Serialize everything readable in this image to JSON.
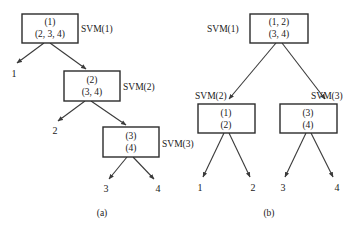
{
  "figure": {
    "panels": [
      {
        "id": "a",
        "caption": "(a)",
        "nodes": [
          {
            "id": "a-n1",
            "line1": "(1)",
            "line2": "(2, 3, 4)",
            "svm": "SVM(1)"
          },
          {
            "id": "a-n2",
            "line1": "(2)",
            "line2": "(3, 4)",
            "svm": "SVM(2)"
          },
          {
            "id": "a-n3",
            "line1": "(3)",
            "line2": "(4)",
            "svm": "SVM(3)"
          }
        ],
        "leaves": [
          {
            "id": "a-l1",
            "label": "1"
          },
          {
            "id": "a-l2",
            "label": "2"
          },
          {
            "id": "a-l3",
            "label": "3"
          },
          {
            "id": "a-l4",
            "label": "4"
          }
        ]
      },
      {
        "id": "b",
        "caption": "(b)",
        "nodes": [
          {
            "id": "b-n1",
            "line1": "(1, 2)",
            "line2": "(3, 4)",
            "svm": "SVM(1)"
          },
          {
            "id": "b-n2",
            "line1": "(1)",
            "line2": "(2)",
            "svm": "SVM(2)"
          },
          {
            "id": "b-n3",
            "line1": "(3)",
            "line2": "(4)",
            "svm": "SVM(3)"
          }
        ],
        "leaves": [
          {
            "id": "b-l1",
            "label": "1"
          },
          {
            "id": "b-l2",
            "label": "2"
          },
          {
            "id": "b-l3",
            "label": "3"
          },
          {
            "id": "b-l4",
            "label": "4"
          }
        ]
      }
    ],
    "colors": {
      "background": "#ffffff",
      "box_stroke": "#2b2b2b",
      "edge_stroke": "#3a3a3a",
      "text": "#1a1a1a"
    }
  }
}
